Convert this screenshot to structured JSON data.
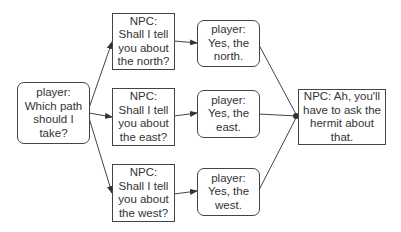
{
  "diagram": {
    "type": "dialogue-tree",
    "nodes": [
      {
        "id": "start",
        "speaker": "player",
        "text": "player:\nWhich path\nshould I\ntake?",
        "shape": "rounded"
      },
      {
        "id": "npc_north",
        "speaker": "NPC",
        "text": "NPC:\nShall I tell\nyou about\nthe north?",
        "shape": "rect"
      },
      {
        "id": "npc_east",
        "speaker": "NPC",
        "text": "NPC:\nShall I tell\nyou about\nthe east?",
        "shape": "rect"
      },
      {
        "id": "npc_west",
        "speaker": "NPC",
        "text": "NPC:\nShall I tell\nyou about\nthe west?",
        "shape": "rect"
      },
      {
        "id": "player_north",
        "speaker": "player",
        "text": "player:\nYes, the\nnorth.",
        "shape": "rounded"
      },
      {
        "id": "player_east",
        "speaker": "player",
        "text": "player:\nYes, the\neast.",
        "shape": "rounded"
      },
      {
        "id": "player_west",
        "speaker": "player",
        "text": "player:\nYes, the\nwest.",
        "shape": "rounded"
      },
      {
        "id": "npc_final",
        "speaker": "NPC",
        "text": "NPC: Ah, you'll\nhave to ask the\nhermit about\nthat.",
        "shape": "rect"
      }
    ],
    "edges": [
      {
        "from": "start",
        "to": "npc_north"
      },
      {
        "from": "start",
        "to": "npc_east"
      },
      {
        "from": "start",
        "to": "npc_west"
      },
      {
        "from": "npc_north",
        "to": "player_north"
      },
      {
        "from": "npc_east",
        "to": "player_east"
      },
      {
        "from": "npc_west",
        "to": "player_west"
      },
      {
        "from": "player_north",
        "to": "npc_final"
      },
      {
        "from": "player_east",
        "to": "npc_final"
      },
      {
        "from": "player_west",
        "to": "npc_final"
      }
    ],
    "colors": {
      "stroke": "#444444",
      "text": "#333333",
      "background": "#ffffff"
    }
  }
}
